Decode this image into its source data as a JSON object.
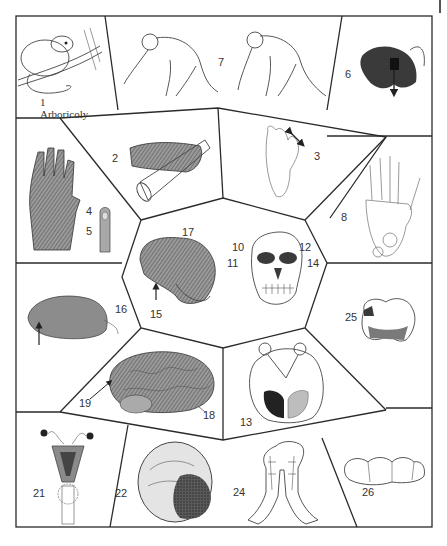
{
  "figure": {
    "panels": [
      {
        "id": "1",
        "label": "1",
        "sublabel": "Arboricoly",
        "subject": "arboreal-mammal-on-branch"
      },
      {
        "id": "7",
        "label": "7",
        "subject": "knuckle-walking-apes"
      },
      {
        "id": "6",
        "label": "6",
        "subject": "baboon-with-arrow"
      },
      {
        "id": "2",
        "label": "2",
        "subject": "hand-grasping-cylinder"
      },
      {
        "id": "3",
        "label": "3",
        "subject": "ape-foot-opposable-toe"
      },
      {
        "id": "4",
        "label": "4",
        "subject": "ape-hand-palm"
      },
      {
        "id": "5",
        "label": "5",
        "subject": "fingertip-nail"
      },
      {
        "id": "8",
        "label": "8",
        "subject": "hand-skeleton"
      },
      {
        "id": "17",
        "label": "17",
        "subject": "skull-lateral"
      },
      {
        "id": "15",
        "label": "15",
        "subject": "skull-arrow-marker"
      },
      {
        "id": "10",
        "label": "10",
        "subject": "skull-frontal"
      },
      {
        "id": "11",
        "label": "11",
        "subject": "skull-frontal"
      },
      {
        "id": "12",
        "label": "12",
        "subject": "skull-frontal"
      },
      {
        "id": "14",
        "label": "14",
        "subject": "skull-frontal"
      },
      {
        "id": "16",
        "label": "16",
        "subject": "brain-small-arrow"
      },
      {
        "id": "25",
        "label": "25",
        "subject": "molar-tooth-crown"
      },
      {
        "id": "19",
        "label": "19",
        "subject": "human-brain-arrow"
      },
      {
        "id": "18",
        "label": "18",
        "subject": "human-brain"
      },
      {
        "id": "13",
        "label": "13",
        "subject": "visual-pathway-diagram"
      },
      {
        "id": "21",
        "label": "21",
        "subject": "uterus-anatomy"
      },
      {
        "id": "22",
        "label": "22",
        "subject": "placenta-egg"
      },
      {
        "id": "24",
        "label": "24",
        "subject": "mandible-dental-arcade"
      },
      {
        "id": "26",
        "label": "26",
        "subject": "molar-row"
      }
    ]
  },
  "caption": {
    "text": ""
  }
}
